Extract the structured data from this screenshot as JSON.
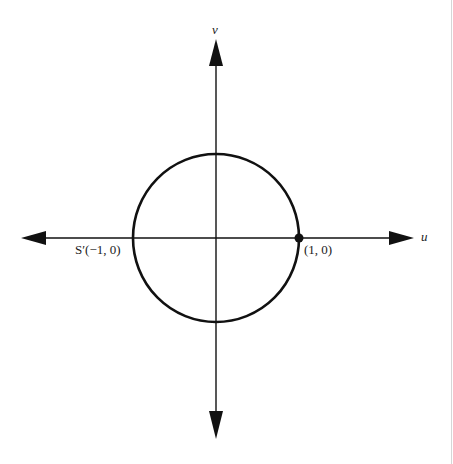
{
  "diagram": {
    "type": "unit-circle-in-uv-plane",
    "axes": {
      "horizontal": {
        "label": "u",
        "arrows": "both"
      },
      "vertical": {
        "label": "v",
        "arrows": "both"
      }
    },
    "circle": {
      "center": [
        0,
        0
      ],
      "radius": 1
    },
    "points": [
      {
        "name": "S'",
        "coords_label": "(−1, 0)",
        "full_label": "S′(−1, 0)",
        "marked": false
      },
      {
        "name": "",
        "coords_label": "(1, 0)",
        "full_label": "(1, 0)",
        "marked": true
      }
    ],
    "colors": {
      "ink": "#111111",
      "background": "#ffffff",
      "edge_line": "#d6d6d6"
    }
  }
}
